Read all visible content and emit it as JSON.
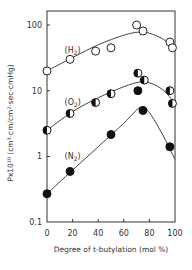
{
  "chart_data": {
    "type": "scatter",
    "title": "",
    "xlabel": "Degree of t-butylation (mol %)",
    "ylabel": "Px10¹⁰ (cm³·cm/cm²·sec·cmHg)",
    "xlim": [
      0,
      100
    ],
    "ylim": [
      0.1,
      150
    ],
    "yscale": "log",
    "x_ticks": [
      0,
      20,
      40,
      60,
      80,
      100
    ],
    "x_tick_labels": [
      "0",
      "20",
      "40",
      "60",
      "80",
      "100"
    ],
    "y_ticks": [
      0.1,
      1,
      10,
      100
    ],
    "y_tick_labels": [
      "0.1",
      "1",
      "10",
      "100"
    ],
    "grid": false,
    "legend": "inline labels",
    "series": [
      {
        "name": "(H2)",
        "label_main": "(H",
        "label_sub": "2",
        "label_close": ")",
        "marker": "open-circle",
        "label_pos": [
          9,
          42
        ],
        "points": [
          [
            0,
            20
          ],
          [
            18,
            30
          ],
          [
            38,
            40
          ],
          [
            50,
            45
          ],
          [
            70,
            100
          ],
          [
            75,
            81
          ],
          [
            96,
            55
          ],
          [
            98,
            45
          ]
        ],
        "curve": [
          [
            0,
            20
          ],
          [
            20,
            32
          ],
          [
            40,
            50
          ],
          [
            60,
            70
          ],
          [
            72,
            78
          ],
          [
            80,
            75
          ],
          [
            90,
            62
          ],
          [
            100,
            45
          ]
        ]
      },
      {
        "name": "(O2)",
        "label_main": "(O",
        "label_sub": "2",
        "label_close": ")",
        "marker": "half-filled-circle",
        "label_pos": [
          9,
          6.8
        ],
        "points": [
          [
            0,
            2.5
          ],
          [
            18,
            4.5
          ],
          [
            38,
            6.6
          ],
          [
            50,
            9.0
          ],
          [
            71,
            18.5
          ],
          [
            76,
            14.5
          ],
          [
            96,
            10
          ],
          [
            98,
            6.4
          ]
        ],
        "curve": [
          [
            0,
            2.5
          ],
          [
            20,
            4.8
          ],
          [
            40,
            7.8
          ],
          [
            60,
            11.5
          ],
          [
            72,
            13.5
          ],
          [
            80,
            13.2
          ],
          [
            90,
            10.5
          ],
          [
            100,
            6.5
          ]
        ]
      },
      {
        "name": "(N2)",
        "label_main": "(N",
        "label_sub": "2",
        "label_close": ")",
        "marker": "filled-circle",
        "label_pos": [
          9,
          1
        ],
        "points": [
          [
            0,
            0.27
          ],
          [
            18,
            0.59
          ],
          [
            50,
            2.15
          ],
          [
            71,
            10
          ],
          [
            75,
            5.0
          ],
          [
            96,
            1.4
          ]
        ],
        "curve": [
          [
            0,
            0.27
          ],
          [
            20,
            0.62
          ],
          [
            40,
            1.4
          ],
          [
            60,
            3.2
          ],
          [
            73,
            5.6
          ],
          [
            80,
            4.6
          ],
          [
            90,
            2.2
          ],
          [
            100,
            0.9
          ]
        ]
      }
    ]
  }
}
